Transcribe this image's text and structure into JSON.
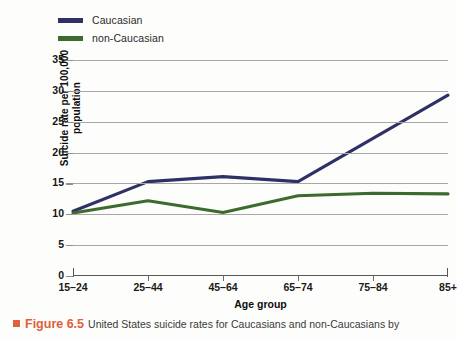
{
  "chart_data": {
    "type": "line",
    "title": "",
    "xlabel": "Age group",
    "ylabel": "Suicide rate per 100,000 population",
    "ylabel_line1": "Suicide rate per 100,000",
    "ylabel_line2": "population",
    "categories": [
      "15–24",
      "25–44",
      "45–64",
      "65–74",
      "75–84",
      "85+"
    ],
    "yticks": [
      "0",
      "5",
      "10",
      "15",
      "20",
      "25",
      "30",
      "35"
    ],
    "ytick_values": [
      0,
      5,
      10,
      15,
      20,
      25,
      30,
      35
    ],
    "ylim": [
      0,
      35
    ],
    "grid": true,
    "legend_position": "top-left",
    "series": [
      {
        "name": "Caucasian",
        "color": "#2f3065",
        "values": [
          10.5,
          15.3,
          16.1,
          15.3,
          22.3,
          29.3
        ]
      },
      {
        "name": "non-Caucasian",
        "color": "#3c6b2d",
        "values": [
          10.2,
          12.2,
          10.3,
          13.0,
          13.4,
          13.3
        ]
      }
    ]
  },
  "legend": {
    "items": [
      {
        "label": "Caucasian",
        "color": "#2f3065"
      },
      {
        "label": "non-Caucasian",
        "color": "#3c6b2d"
      }
    ]
  },
  "caption": {
    "figure_number": "Figure 6.5",
    "text": "United States suicide rates for Caucasians and non-Caucasians by",
    "marker_color": "#e0603a"
  },
  "colors": {
    "caucasian": "#2f3065",
    "non_caucasian": "#3c6b2d",
    "gridline": "#a8a8a8",
    "axis": "#585858",
    "accent": "#e0603a"
  }
}
